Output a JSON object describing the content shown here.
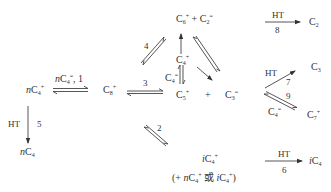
{
  "diagram": {
    "type": "reaction-network",
    "species": {
      "nC4_plus": {
        "prefix": "n",
        "element": "C",
        "sub": "4",
        "sup": "+"
      },
      "C8_plus": {
        "prefix": "",
        "element": "C",
        "sub": "8",
        "sup": "+"
      },
      "C6_C2": {
        "left": {
          "element": "C",
          "sub": "6",
          "sup": "+"
        },
        "op": "+",
        "right": {
          "element": "C",
          "sub": "2",
          "sup": "="
        }
      },
      "C4_plus_mid": {
        "prefix": "",
        "element": "C",
        "sub": "4",
        "sup": "+"
      },
      "C4_eq_side": {
        "prefix": "",
        "element": "C",
        "sub": "4",
        "sup": "="
      },
      "C5_C3": {
        "left": {
          "element": "C",
          "sub": "5",
          "sup": "+"
        },
        "op": "+",
        "right": {
          "element": "C",
          "sub": "3",
          "sup": "="
        }
      },
      "C2": {
        "prefix": "",
        "element": "C",
        "sub": "2",
        "sup": ""
      },
      "C3": {
        "prefix": "",
        "element": "C",
        "sub": "3",
        "sup": ""
      },
      "C4_eq_lower": {
        "prefix": "",
        "element": "C",
        "sub": "4",
        "sup": "="
      },
      "C7_plus": {
        "prefix": "",
        "element": "C",
        "sub": "7",
        "sup": "+"
      },
      "nC4": {
        "prefix": "n",
        "element": "C",
        "sub": "4",
        "sup": ""
      },
      "iC4_plus": {
        "prefix": "i",
        "element": "C",
        "sub": "4",
        "sup": "+"
      },
      "iC4_note": {
        "open": "(+ ",
        "a_prefix": "n",
        "a_element": "C",
        "a_sub": "4",
        "a_sup": "+",
        "or": " 或 ",
        "b_prefix": "i",
        "b_element": "C",
        "b_sub": "4",
        "b_sup": "+",
        "close": ")"
      },
      "iC4": {
        "prefix": "i",
        "element": "C",
        "sub": "4",
        "sup": ""
      }
    },
    "reactions": [
      {
        "id": "1",
        "label": "nC4=, 1",
        "label_parts": {
          "prefix": "n",
          "element": "C",
          "sub": "4",
          "sup": "=",
          "suffix": ", 1"
        },
        "from": "nC4+",
        "to": "C8+",
        "reversible": true
      },
      {
        "id": "2",
        "label": "2",
        "from": "C8+",
        "to": "iC4+",
        "reversible": true
      },
      {
        "id": "3",
        "label": "3",
        "from": "C8+",
        "to": "C5+ + C3=",
        "reversible": true
      },
      {
        "id": "4",
        "label": "4",
        "from": "C8+",
        "to": "C6+ + C2=",
        "reversible": true
      },
      {
        "id": "5",
        "label": "5",
        "condition": "HT",
        "from": "nC4+",
        "to": "nC4",
        "reversible": false
      },
      {
        "id": "6",
        "label": "6",
        "condition": "HT",
        "from": "iC4+",
        "to": "iC4",
        "reversible": false
      },
      {
        "id": "7",
        "label": "7",
        "condition": "HT",
        "from": "C3+",
        "to": "C3",
        "reversible": false
      },
      {
        "id": "8",
        "label": "8",
        "condition": "HT",
        "from": "C2+",
        "to": "C2",
        "reversible": false
      },
      {
        "id": "9",
        "label": "9",
        "from": "C3+ + C4=",
        "to": "C7+",
        "reversible": true
      }
    ],
    "labels": {
      "r1": ", 1",
      "r2": "2",
      "r3": "3",
      "r4": "4",
      "r5": "5",
      "r6": "6",
      "r7": "7",
      "r8": "8",
      "r9": "9",
      "ht5": "HT",
      "ht6": "HT",
      "ht7": "HT",
      "ht8": "HT",
      "plus": "+"
    },
    "colors": {
      "ink": "#333333",
      "background": "#ffffff"
    }
  }
}
